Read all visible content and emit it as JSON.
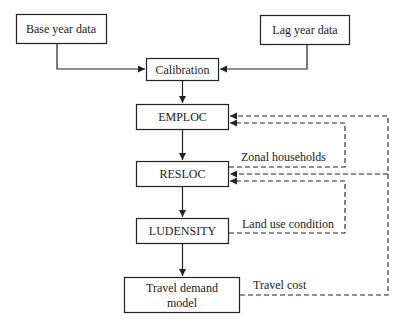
{
  "diagram": {
    "nodes": {
      "base_year": "Base year data",
      "lag_year": "Lag year data",
      "calibration": "Calibration",
      "emploc": "EMPLOC",
      "resloc": "RESLOC",
      "ludensity": "LUDENSITY",
      "travel_demand_line1": "Travel demand",
      "travel_demand_line2": "model"
    },
    "edge_labels": {
      "zonal_households": "Zonal households",
      "land_use_condition": "Land use condition",
      "travel_cost": "Travel cost"
    },
    "edges": [
      {
        "from": "Base year data",
        "to": "Calibration",
        "style": "solid"
      },
      {
        "from": "Lag year data",
        "to": "Calibration",
        "style": "solid"
      },
      {
        "from": "Calibration",
        "to": "EMPLOC",
        "style": "solid"
      },
      {
        "from": "EMPLOC",
        "to": "RESLOC",
        "style": "solid"
      },
      {
        "from": "RESLOC",
        "to": "LUDENSITY",
        "style": "solid"
      },
      {
        "from": "LUDENSITY",
        "to": "Travel demand model",
        "style": "solid"
      },
      {
        "from": "RESLOC",
        "to": "EMPLOC",
        "style": "dashed",
        "label": "Zonal households"
      },
      {
        "from": "LUDENSITY",
        "to": "RESLOC",
        "style": "dashed",
        "label": "Land use condition"
      },
      {
        "from": "Travel demand model",
        "to": "EMPLOC",
        "style": "dashed",
        "label": "Travel cost"
      },
      {
        "from": "Travel demand model",
        "to": "RESLOC",
        "style": "dashed",
        "label": "Travel cost"
      }
    ]
  }
}
